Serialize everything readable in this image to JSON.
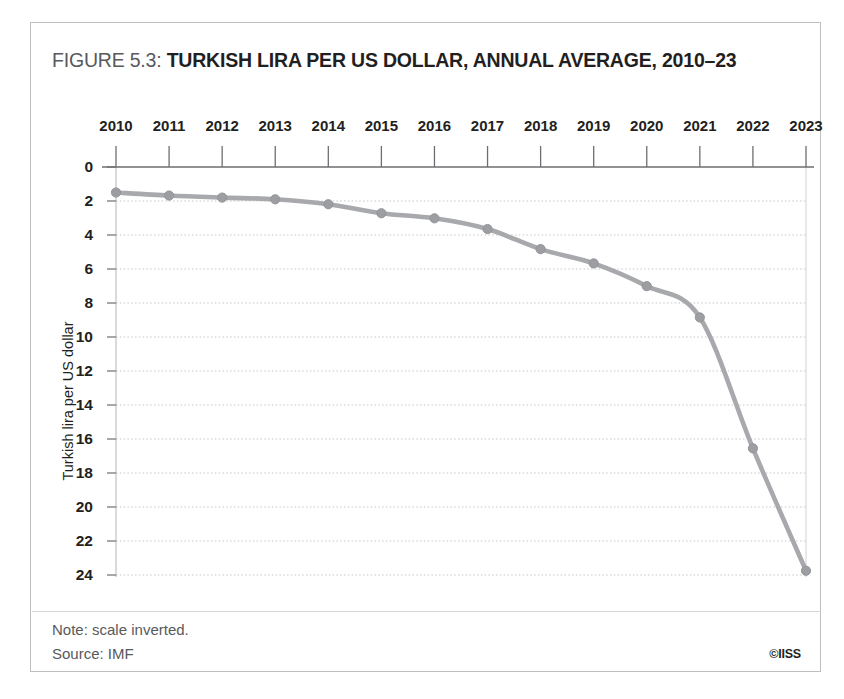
{
  "figure": {
    "number_label": "FIGURE 5.3:",
    "headline": "TURKISH LIRA PER US DOLLAR, ANNUAL AVERAGE, 2010–23",
    "note": "Note: scale inverted.",
    "source": "Source: IMF",
    "copyright": "©IISS"
  },
  "colors": {
    "line": "#a7a9ac",
    "marker": "#9c9ea1",
    "gridline": "#c9c9c9",
    "axis": "#808285",
    "frame": "#bfbfbf",
    "text": "#231f20",
    "muted_text": "#58595b"
  },
  "chart_data": {
    "type": "line",
    "title": "TURKISH LIRA PER US DOLLAR, ANNUAL AVERAGE, 2010–23",
    "xlabel": "",
    "ylabel": "Turkish lira per US dollar",
    "x": [
      2010,
      2011,
      2012,
      2013,
      2014,
      2015,
      2016,
      2017,
      2018,
      2019,
      2020,
      2021,
      2022,
      2023
    ],
    "categories": [
      "2010",
      "2011",
      "2012",
      "2013",
      "2014",
      "2015",
      "2016",
      "2017",
      "2018",
      "2019",
      "2020",
      "2021",
      "2022",
      "2023"
    ],
    "values": [
      1.5,
      1.68,
      1.8,
      1.9,
      2.19,
      2.72,
      3.02,
      3.65,
      4.83,
      5.67,
      7.01,
      8.85,
      16.55,
      23.75
    ],
    "series": [
      {
        "name": "Turkish lira per US dollar",
        "values": [
          1.5,
          1.68,
          1.8,
          1.9,
          2.19,
          2.72,
          3.02,
          3.65,
          4.83,
          5.67,
          7.01,
          8.85,
          16.55,
          23.75
        ]
      }
    ],
    "ylim": [
      0,
      24
    ],
    "y_inverted": true,
    "y_ticks": [
      0,
      2,
      4,
      6,
      8,
      10,
      12,
      14,
      16,
      18,
      20,
      22,
      24
    ],
    "y_tick_labels": [
      "0",
      "2",
      "4",
      "6",
      "8",
      "10",
      "12",
      "14",
      "16",
      "18",
      "20",
      "22",
      "24"
    ],
    "x_ticks": [
      2010,
      2011,
      2012,
      2013,
      2014,
      2015,
      2016,
      2017,
      2018,
      2019,
      2020,
      2021,
      2022,
      2023
    ],
    "grid": true,
    "grid_axis": "y",
    "legend": false,
    "markers": true,
    "line_style": "smooth"
  }
}
